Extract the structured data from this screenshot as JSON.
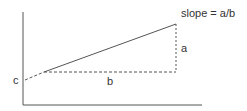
{
  "diagram": {
    "labels": {
      "intercept": "c",
      "rise": "a",
      "run": "b",
      "slope": "slope = a/b"
    },
    "colors": {
      "line": "#555555",
      "text": "#333333",
      "axis": "#555555"
    }
  }
}
